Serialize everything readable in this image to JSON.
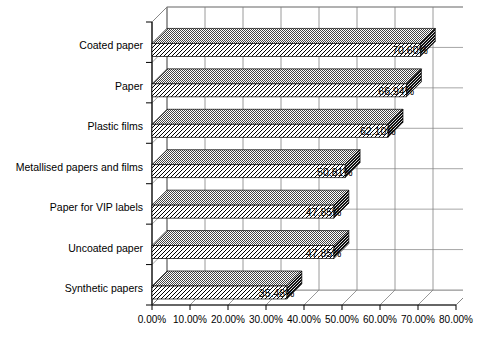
{
  "chart_data": {
    "type": "bar",
    "orientation": "horizontal",
    "style": "3d",
    "title": "",
    "xlabel": "",
    "ylabel": "",
    "categories": [
      "Coated paper",
      "Paper",
      "Plastic films",
      "Metallised papers and films",
      "Paper for VIP labels",
      "Uncoated paper",
      "Synthetic papers"
    ],
    "values": [
      70.6,
      66.94,
      62.1,
      50.81,
      47.85,
      47.85,
      35.48
    ],
    "value_labels": [
      "70.60%",
      "66.94%",
      "62.10%",
      "50.81%",
      "47.85%",
      "47.85%",
      "35.48%"
    ],
    "xlim": [
      0,
      80
    ],
    "xtick_values": [
      0,
      10,
      20,
      30,
      40,
      50,
      60,
      70,
      80
    ],
    "xtick_labels": [
      "0.00%",
      "10.00%",
      "20.00%",
      "30.00%",
      "40.00%",
      "50.00%",
      "60.00%",
      "70.00%",
      "80.00%"
    ],
    "grid": true,
    "legend": null,
    "units": "percent",
    "series_name": ""
  },
  "colors": {
    "background": "#ffffff",
    "axis": "#000000",
    "gridline": "#808080",
    "bar_top_face": "#555555",
    "bar_front_face": "#ffffff",
    "bar_hatch": "#000000",
    "bar_cap": "#333333",
    "text": "#000000"
  }
}
